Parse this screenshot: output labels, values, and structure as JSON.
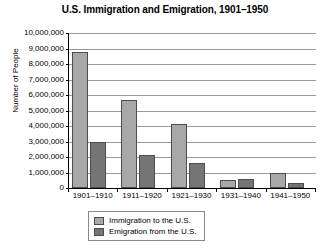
{
  "chart_data": {
    "type": "bar",
    "title": "U.S. Immigration and Emigration, 1901–1950",
    "xlabel": "",
    "ylabel": "Number of People",
    "categories": [
      "1901–1910",
      "1911–1920",
      "1921–1930",
      "1931–1940",
      "1941–1950"
    ],
    "series": [
      {
        "name": "Immigration to the U.S.",
        "color": "#a8a8a8",
        "values": [
          8800000,
          5700000,
          4100000,
          500000,
          1000000
        ]
      },
      {
        "name": "Emigration from the U.S.",
        "color": "#757575",
        "values": [
          3000000,
          2100000,
          1600000,
          550000,
          300000
        ]
      }
    ],
    "ylim": [
      0,
      10000000
    ],
    "ytick_values": [
      0,
      1000000,
      2000000,
      3000000,
      4000000,
      5000000,
      6000000,
      7000000,
      8000000,
      9000000,
      10000000
    ],
    "ytick_labels": [
      "0",
      "1,000,000",
      "2,000,000",
      "3,000,000",
      "4,000,000",
      "5,000,000",
      "6,000,000",
      "7,000,000",
      "8,000,000",
      "9,000,000",
      "10,000,000"
    ],
    "grid": true,
    "legend_position": "bottom"
  }
}
